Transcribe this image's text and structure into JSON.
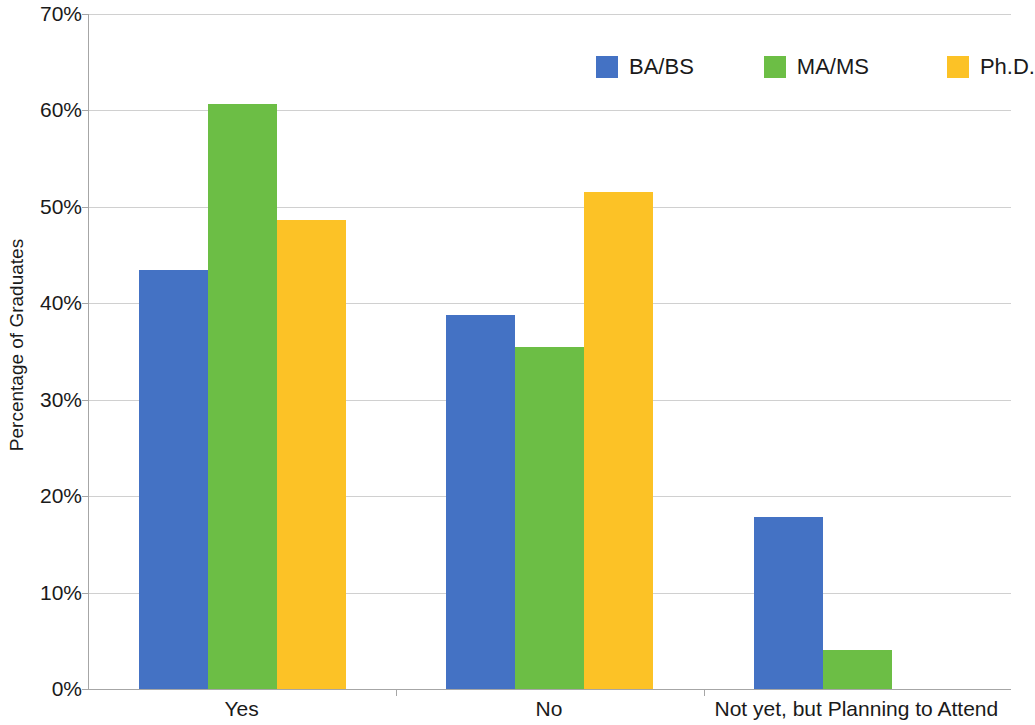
{
  "chart_data": {
    "type": "bar",
    "title": "",
    "subtitle": "",
    "xlabel": "",
    "ylabel": "Percentage of Graduates",
    "categories": [
      "Yes",
      "No",
      "Not yet, but Planning to Attend"
    ],
    "series": [
      {
        "name": "BA/BS",
        "color": "#4472C4",
        "values": [
          43.5,
          38.8,
          17.8
        ]
      },
      {
        "name": "MA/MS",
        "color": "#6CBE45",
        "values": [
          60.7,
          35.5,
          4.0
        ]
      },
      {
        "name": "Ph.D.",
        "color": "#FCC226",
        "values": [
          48.6,
          51.5,
          0
        ]
      }
    ],
    "ylim": [
      0,
      70
    ],
    "ytick_values": [
      70,
      60,
      50,
      40,
      30,
      20,
      10,
      0
    ],
    "ytick_labels": [
      "70%",
      "60%",
      "50%",
      "40%",
      "30%",
      "20%",
      "10%",
      "0%"
    ],
    "grid": true,
    "grid_axis": "y",
    "legend_position": "top-right",
    "bar_orientation": "vertical",
    "grouping": "grouped"
  },
  "axes": {
    "y_title": "Percentage of Graduates",
    "ticks": [
      {
        "label": "70%",
        "value": 70
      },
      {
        "label": "60%",
        "value": 60
      },
      {
        "label": "50%",
        "value": 50
      },
      {
        "label": "40%",
        "value": 40
      },
      {
        "label": "30%",
        "value": 30
      },
      {
        "label": "20%",
        "value": 20
      },
      {
        "label": "10%",
        "value": 10
      },
      {
        "label": "0%",
        "value": 0
      }
    ],
    "categories": [
      "Yes",
      "No",
      "Not yet, but Planning to Attend"
    ]
  },
  "legend": {
    "items": [
      {
        "label": "BA/BS",
        "color": "#4472C4"
      },
      {
        "label": "MA/MS",
        "color": "#6CBE45"
      },
      {
        "label": "Ph.D.",
        "color": "#FCC226"
      }
    ]
  },
  "colors": {
    "ba_bs": "#4472C4",
    "ma_ms": "#6CBE45",
    "phd": "#FCC226",
    "gridline": "#d0d0d0",
    "axis": "#a6a6a6",
    "text": "#1a1a1a",
    "background": "#ffffff"
  }
}
